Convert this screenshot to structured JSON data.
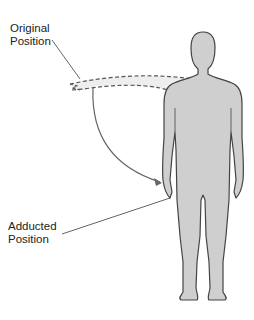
{
  "diagram": {
    "labels": {
      "original": {
        "line1": "Original",
        "line2": "Position"
      },
      "adducted": {
        "line1": "Adducted",
        "line2": "Position"
      }
    },
    "colors": {
      "body_fill": "#cfcfcf",
      "body_outline": "#444444",
      "dashed_arm_fill": "#eeeeee",
      "dashed_line": "#555555",
      "arrow": "#666666",
      "leader_line": "#555555",
      "background": "#ffffff"
    }
  }
}
